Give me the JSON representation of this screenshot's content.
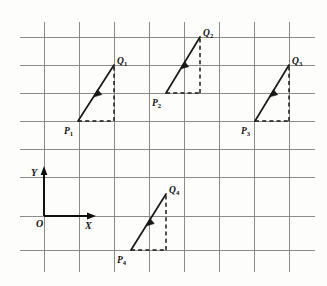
{
  "figure": {
    "background_color": "#fdfdfb",
    "grid_color": "#7d7f80",
    "ink_color": "#191919",
    "width": 327,
    "height": 286
  },
  "axes": {
    "origin_label": "O",
    "x_label": "X",
    "y_label": "Y",
    "origin_px": [
      44,
      216
    ],
    "x_axis_end_px": [
      96,
      216
    ],
    "y_axis_end_px": [
      44,
      167
    ]
  },
  "grid": {
    "vertical_x": [
      44,
      79,
      114,
      149,
      184,
      219,
      254,
      289
    ],
    "horizontal_y": [
      37,
      65,
      93,
      121,
      149,
      177,
      216,
      250
    ],
    "spacing_px": 35
  },
  "vectors": [
    {
      "name": "vector-1",
      "tail_label": "P",
      "tail_sub": "1",
      "head_label": "Q",
      "head_sub": "2",
      "tail_px": [
        78,
        121
      ],
      "head_px": [
        114,
        65
      ],
      "tail_label_px": [
        67,
        133
      ],
      "head_label_px": [
        117,
        62
      ]
    },
    {
      "name": "vector-2",
      "tail_label": "P",
      "tail_sub": "2",
      "head_label": "Q",
      "head_sub": "2",
      "tail_px": [
        166,
        93
      ],
      "head_px": [
        200,
        37
      ],
      "tail_label_px": [
        155,
        105
      ],
      "head_label_px": [
        203,
        34
      ]
    },
    {
      "name": "vector-3",
      "tail_label": "P",
      "tail_sub": "3",
      "head_label": "Q",
      "head_sub": "3",
      "tail_px": [
        255,
        121
      ],
      "head_px": [
        289,
        65
      ],
      "tail_label_px": [
        244,
        133
      ],
      "head_label_px": [
        292,
        62
      ]
    },
    {
      "name": "vector-4",
      "tail_label": "P",
      "tail_sub": "4",
      "head_label": "Q",
      "head_sub": "4",
      "tail_px": [
        131,
        250
      ],
      "head_px": [
        166,
        194
      ],
      "tail_label_px": [
        120,
        262
      ],
      "head_label_px": [
        169,
        191
      ]
    }
  ],
  "labels": {
    "p1": "P",
    "p1_sub": "1",
    "q1": "Q",
    "q1_sub": "1",
    "p2": "P",
    "p2_sub": "2",
    "q2": "Q",
    "q2_sub": "2",
    "p3": "P",
    "p3_sub": "3",
    "q3": "Q",
    "q3_sub": "3",
    "p4": "P",
    "p4_sub": "4",
    "q4": "Q",
    "q4_sub": "4",
    "origin": "O",
    "x": "X",
    "y": "Y"
  }
}
